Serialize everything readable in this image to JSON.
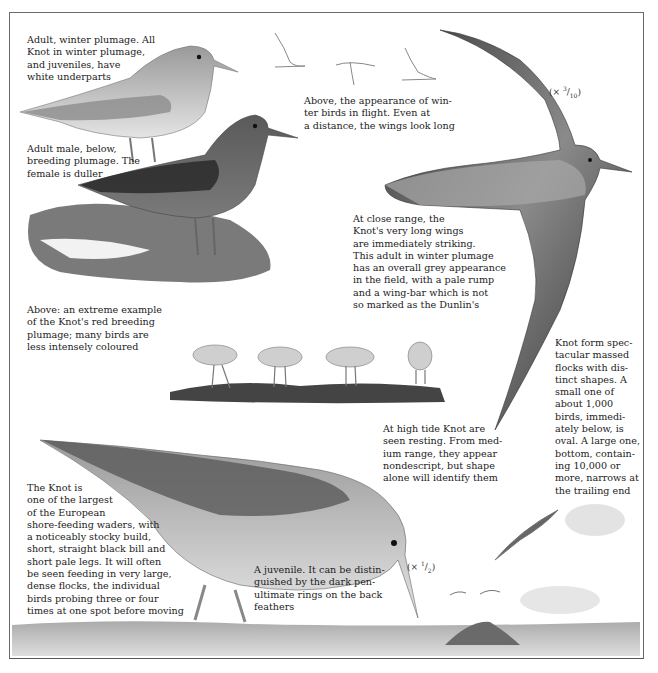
{
  "page": {
    "subject": "Knot",
    "colors": {
      "ink": "#1e1e1e",
      "paper": "#ffffff",
      "frame": "#6a6a6a"
    }
  },
  "captions": {
    "winter_adult": [
      "Adult, winter plumage. All",
      "Knot in winter plumage,",
      "and juveniles, have",
      "white underparts"
    ],
    "breeding_male": [
      "Adult male, below,",
      "breeding plumage. The",
      "female is duller"
    ],
    "flight_winter": [
      "Above, the appearance of win-",
      "ter birds in flight. Even at",
      "a distance, the wings look long"
    ],
    "close_range": [
      "At close range, the",
      "Knot's very long wings",
      "are immediately striking.",
      "This adult in winter plumage",
      "has an overall grey appearance",
      "in the field, with a pale rump",
      "and a wing-bar which is not",
      "so marked as the Dunlin's"
    ],
    "red_breeding": [
      "Above: an extreme example",
      "of the Knot's red breeding",
      "plumage; many birds are",
      "less intensely coloured"
    ],
    "flocks": [
      "Knot form spec-",
      "tacular massed",
      "flocks with dis-",
      "tinct shapes. A",
      "small one of",
      "about 1,000",
      "birds, immedi-",
      "ately below, is",
      "oval. A large one,",
      "bottom, contain-",
      "ing 10,000 or",
      "more, narrows at",
      "the trailing end"
    ],
    "high_tide": [
      "At high tide Knot are",
      "seen resting. From med-",
      "ium range, they appear",
      "nondescript, but shape",
      "alone will identify them"
    ],
    "main_description": [
      "The Knot is",
      "one of the largest",
      "of the European",
      "shore-feeding waders, with",
      "a noticeably stocky build,",
      "short, straight black bill and",
      "short pale legs. It will often",
      "be seen feeding in very large,",
      "dense flocks, the individual",
      "birds probing three or four",
      "times at one spot before moving"
    ],
    "juvenile": [
      "A juvenile. It can be distin-",
      "guished by the dark pen-",
      "ultimate rings on the back",
      "feathers"
    ]
  },
  "scales": {
    "flight_bird": {
      "prefix": "(× ",
      "num": "3",
      "den": "10",
      "suffix": ")"
    },
    "juvenile": {
      "prefix": "(× ",
      "num": "1",
      "den": "2",
      "suffix": ")"
    }
  },
  "illustrations": [
    "winter-adult-knot",
    "breeding-male-knot",
    "flying-knot-large",
    "winter-flight-silhouettes",
    "resting-flock-high-tide",
    "juvenile-knot-feeding",
    "flock-shapes-small-oval",
    "flock-shapes-large",
    "distant-flying-birds",
    "shoreline-mudflat"
  ]
}
